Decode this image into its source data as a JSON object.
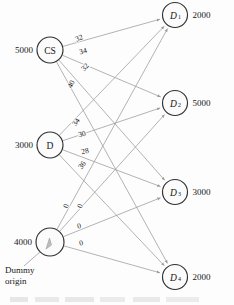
{
  "figure": {
    "caption_fragment": ""
  },
  "colors": {
    "node_stroke": "#303030",
    "node_fill": "#fbfbfb",
    "edge": "#9a9a9a",
    "text": "#181818",
    "background": "#fdfdfd"
  },
  "origins": [
    {
      "id": "CS",
      "label": "CS",
      "supply": "5000",
      "cx": 50,
      "cy": 50,
      "r": 13
    },
    {
      "id": "D",
      "label": "D",
      "supply": "3000",
      "cx": 50,
      "cy": 145,
      "r": 13
    },
    {
      "id": "DUMMY",
      "label": "",
      "supply": "4000",
      "cx": 50,
      "cy": 242,
      "r": 14,
      "annotation_line1": "Dummy",
      "annotation_line2": "origin"
    }
  ],
  "destinations": [
    {
      "id": "D1",
      "label": "D",
      "sub": "1",
      "demand": "2000",
      "cx": 175,
      "cy": 15,
      "r": 12.5
    },
    {
      "id": "D2",
      "label": "D",
      "sub": "2",
      "demand": "5000",
      "cx": 175,
      "cy": 103,
      "r": 12.5
    },
    {
      "id": "D3",
      "label": "D",
      "sub": "3",
      "demand": "3000",
      "cx": 175,
      "cy": 192,
      "r": 12.5
    },
    {
      "id": "D4",
      "label": "D",
      "sub": "4",
      "demand": "2000",
      "cx": 175,
      "cy": 277,
      "r": 12.5
    }
  ],
  "edges": [
    {
      "from": "CS",
      "to": "D1",
      "cost": "32",
      "lx": 79,
      "ly": 38,
      "rot": -22
    },
    {
      "from": "CS",
      "to": "D2",
      "cost": "34",
      "lx": 83,
      "ly": 51,
      "rot": -16
    },
    {
      "from": "CS",
      "to": "D3",
      "cost": "32",
      "lx": 85,
      "ly": 67,
      "rot": -48
    },
    {
      "from": "CS",
      "to": "D4",
      "cost": "40",
      "lx": 71,
      "ly": 84,
      "rot": -63
    },
    {
      "from": "D",
      "to": "D1",
      "cost": "34",
      "lx": 76,
      "ly": 122,
      "rot": -55
    },
    {
      "from": "D",
      "to": "D2",
      "cost": "30",
      "lx": 82,
      "ly": 134,
      "rot": -14
    },
    {
      "from": "D",
      "to": "D3",
      "cost": "28",
      "lx": 85,
      "ly": 151,
      "rot": -12
    },
    {
      "from": "D",
      "to": "D4",
      "cost": "36",
      "lx": 82,
      "ly": 165,
      "rot": -53
    },
    {
      "from": "DUMMY",
      "to": "D1",
      "cost": "0",
      "lx": 66,
      "ly": 206,
      "rot": -72
    },
    {
      "from": "DUMMY",
      "to": "D2",
      "cost": "0",
      "lx": 80,
      "ly": 206,
      "rot": -72
    },
    {
      "from": "DUMMY",
      "to": "D3",
      "cost": "0",
      "lx": 79,
      "ly": 226,
      "rot": -12
    },
    {
      "from": "DUMMY",
      "to": "D4",
      "cost": "0",
      "lx": 81,
      "ly": 243,
      "rot": -12
    }
  ],
  "chart_data": {
    "type": "diagram",
    "origins": [
      {
        "name": "CS",
        "supply": 5000
      },
      {
        "name": "D",
        "supply": 3000
      },
      {
        "name": "Dummy origin",
        "supply": 4000
      }
    ],
    "destinations": [
      {
        "name": "D1",
        "demand": 2000
      },
      {
        "name": "D2",
        "demand": 5000
      },
      {
        "name": "D3",
        "demand": 3000
      },
      {
        "name": "D4",
        "demand": 2000
      }
    ],
    "cost_matrix": [
      {
        "origin": "CS",
        "costs": {
          "D1": 32,
          "D2": 34,
          "D3": 32,
          "D4": 40
        }
      },
      {
        "origin": "D",
        "costs": {
          "D1": 34,
          "D2": 30,
          "D3": 28,
          "D4": 36
        }
      },
      {
        "origin": "Dummy",
        "costs": {
          "D1": 0,
          "D2": 0,
          "D3": 0,
          "D4": 0
        }
      }
    ]
  }
}
